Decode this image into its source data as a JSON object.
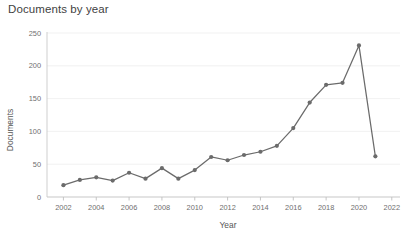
{
  "widget": {
    "title": "Documents by year",
    "background_color": "#ffffff"
  },
  "chart_data": {
    "type": "line",
    "title": "Documents by year",
    "xlabel": "Year",
    "ylabel": "Documents",
    "x": [
      2002,
      2003,
      2004,
      2005,
      2006,
      2007,
      2008,
      2009,
      2010,
      2011,
      2012,
      2013,
      2014,
      2015,
      2016,
      2017,
      2018,
      2019,
      2020,
      2021
    ],
    "values": [
      18,
      26,
      30,
      25,
      37,
      28,
      44,
      28,
      41,
      61,
      56,
      64,
      69,
      78,
      105,
      144,
      171,
      174,
      231,
      62
    ],
    "series": [
      {
        "name": "Documents",
        "values": [
          18,
          26,
          30,
          25,
          37,
          28,
          44,
          28,
          41,
          61,
          56,
          64,
          69,
          78,
          105,
          144,
          171,
          174,
          231,
          62
        ],
        "color": "#6b6b6b",
        "marker": "circle"
      }
    ],
    "xlim": [
      2001,
      2022.5
    ],
    "ylim": [
      0,
      250
    ],
    "xticks": [
      2002,
      2004,
      2006,
      2008,
      2010,
      2012,
      2014,
      2016,
      2018,
      2020,
      2022
    ],
    "xtick_labels": [
      "2002",
      "2004",
      "2006",
      "2008",
      "2010",
      "2012",
      "2014",
      "2016",
      "2018",
      "2020",
      "2022"
    ],
    "yticks": [
      0,
      50,
      100,
      150,
      200,
      250
    ],
    "ytick_labels": [
      "0",
      "50",
      "100",
      "150",
      "200",
      "250"
    ],
    "grid": "horizontal",
    "legend": "none",
    "line_color": "#6b6b6b",
    "grid_color": "#ededed"
  }
}
